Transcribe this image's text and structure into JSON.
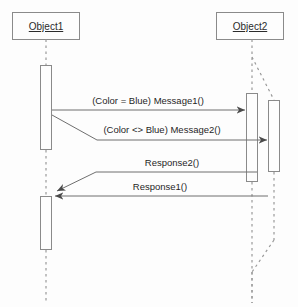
{
  "diagram": {
    "type": "uml-sequence-diagram",
    "background_color": "#fdfdfd",
    "line_color": "#8a8a8a",
    "text_color": "#1f1f1f",
    "participants": [
      {
        "id": "object1",
        "label": "Object1"
      },
      {
        "id": "object2",
        "label": "Object2"
      }
    ],
    "messages": [
      {
        "id": "message1",
        "label": "(Color = Blue) Message1()",
        "from": "object1",
        "to": "object2",
        "direction": "right"
      },
      {
        "id": "message2",
        "label": "(Color <> Blue) Message2()",
        "from": "object1",
        "to": "object2",
        "direction": "right"
      },
      {
        "id": "response2",
        "label": "Response2()",
        "from": "object2",
        "to": "object1",
        "direction": "left"
      },
      {
        "id": "response1",
        "label": "Response1()",
        "from": "object2",
        "to": "object1",
        "direction": "left"
      }
    ]
  }
}
